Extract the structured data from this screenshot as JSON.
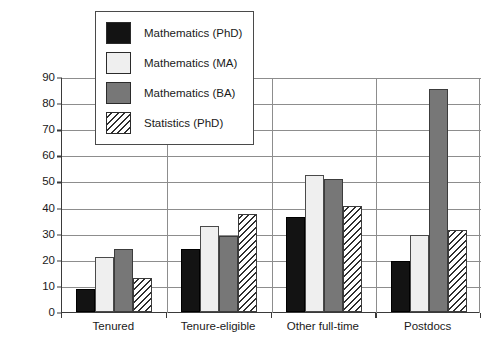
{
  "chart_data": {
    "type": "bar",
    "title": "",
    "xlabel": "",
    "ylabel": "Percentage of Women",
    "ylim": [
      0,
      90
    ],
    "yticks": [
      0,
      10,
      20,
      30,
      40,
      50,
      60,
      70,
      80,
      90
    ],
    "grid": true,
    "legend_position": "upper-left-inside",
    "categories": [
      "Tenured",
      "Tenure-eligible",
      "Other full-time",
      "Postdocs"
    ],
    "series": [
      {
        "name": "Mathematics (PhD)",
        "style": "solid-black",
        "color": "#131313",
        "values": [
          9,
          24,
          36.5,
          19.5
        ]
      },
      {
        "name": "Mathematics (MA)",
        "style": "solid-white",
        "color": "#efefef",
        "values": [
          21,
          33,
          52.5,
          29.5
        ]
      },
      {
        "name": "Mathematics (BA)",
        "style": "solid-gray",
        "color": "#777777",
        "values": [
          24,
          29,
          51,
          85.5
        ]
      },
      {
        "name": "Statistics (PhD)",
        "style": "diagonal-hatch",
        "color": "#ffffff",
        "values": [
          13,
          37.5,
          40.5,
          31.5
        ]
      }
    ]
  },
  "axis": {
    "y_title": "Percentage of Women",
    "y_tick_labels": [
      "0",
      "10",
      "20",
      "30",
      "40",
      "50",
      "60",
      "70",
      "80",
      "90"
    ],
    "x_tick_labels": [
      "Tenured",
      "Tenure-eligible",
      "Other full-time",
      "Postdocs"
    ]
  },
  "legend": {
    "entries": [
      {
        "label": "Mathematics (PhD)"
      },
      {
        "label": "Mathematics (MA)"
      },
      {
        "label": "Mathematics (BA)"
      },
      {
        "label": "Statistics (PhD)"
      }
    ]
  },
  "colors": {
    "phd": "#131313",
    "ma": "#efefef",
    "ba": "#777777",
    "stats": "#ffffff",
    "grid": "#8d8d8d",
    "axis": "#3a3a3a"
  }
}
